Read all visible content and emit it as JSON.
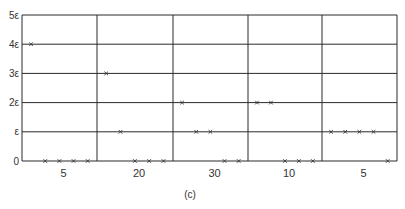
{
  "chart_data": {
    "type": "scatter",
    "title": "",
    "caption": "(c)",
    "xlabel": "",
    "ylabel": "",
    "y_ticks": [
      "0",
      "ε",
      "2ε",
      "3ε",
      "4ε",
      "5ε"
    ],
    "ylim": [
      0,
      5
    ],
    "grid": true,
    "panels": [
      {
        "label": "5",
        "points": [
          4,
          0,
          0,
          0,
          0
        ]
      },
      {
        "label": "20",
        "points": [
          3,
          1,
          0,
          0,
          0
        ]
      },
      {
        "label": "30",
        "points": [
          2,
          1,
          1,
          0,
          0
        ]
      },
      {
        "label": "10",
        "points": [
          2,
          2,
          0,
          0,
          0
        ]
      },
      {
        "label": "5",
        "points": [
          1,
          1,
          1,
          1,
          0
        ]
      }
    ],
    "marker": "x",
    "colors": {
      "lines": "#2a2a2a",
      "markers": "#333333",
      "background": "#ffffff"
    }
  }
}
